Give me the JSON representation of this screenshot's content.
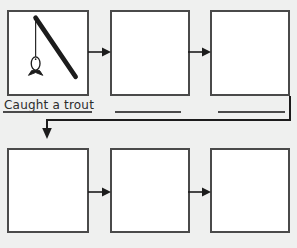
{
  "page": {
    "background_color": "#eff0ef",
    "panel_fill": "#ffffff",
    "ink_color": "#4a4a4a",
    "text_color": "#2b2b2b"
  },
  "rows": [
    {
      "name": "top-row",
      "panels": [
        {
          "index": 1,
          "drawing": "fishing-rod-with-fish",
          "drawing_parts": [
            "fishing-rod",
            "fishing-line",
            "fish"
          ],
          "content": ""
        },
        {
          "index": 2,
          "drawing": "",
          "content": ""
        },
        {
          "index": 3,
          "drawing": "",
          "content": ""
        }
      ],
      "captions": [
        {
          "index": 1,
          "text": "Caught a trout"
        },
        {
          "index": 2,
          "text": ""
        },
        {
          "index": 3,
          "text": ""
        }
      ]
    },
    {
      "name": "bottom-row",
      "panels": [
        {
          "index": 4,
          "drawing": "",
          "content": ""
        },
        {
          "index": 5,
          "drawing": "",
          "content": ""
        },
        {
          "index": 6,
          "drawing": "",
          "content": ""
        }
      ],
      "captions": []
    }
  ],
  "connectors": [
    {
      "name": "arrow-panel1-to-panel2",
      "direction": "right"
    },
    {
      "name": "arrow-panel2-to-panel3",
      "direction": "right"
    },
    {
      "name": "arrow-panel3-to-panel4",
      "direction": "wrap-down-left"
    },
    {
      "name": "arrow-panel4-to-panel5",
      "direction": "right"
    },
    {
      "name": "arrow-panel5-to-panel6",
      "direction": "right"
    }
  ]
}
